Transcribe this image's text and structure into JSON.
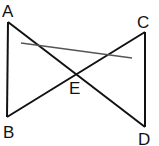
{
  "diagram": {
    "points": {
      "A": {
        "label": "A",
        "x": 8,
        "y": 22
      },
      "B": {
        "label": "B",
        "x": 7,
        "y": 117
      },
      "C": {
        "label": "C",
        "x": 145,
        "y": 32
      },
      "D": {
        "label": "D",
        "x": 145,
        "y": 127
      },
      "E": {
        "label": "E",
        "x": 76,
        "y": 74
      }
    },
    "segments": [
      {
        "from": "A",
        "to": "B"
      },
      {
        "from": "A",
        "to": "D"
      },
      {
        "from": "B",
        "to": "C"
      },
      {
        "from": "C",
        "to": "D"
      }
    ],
    "transversal": {
      "x1": 21,
      "y1": 43,
      "x2": 132,
      "y2": 58,
      "color": "#555555"
    },
    "line_color": "#111111"
  }
}
